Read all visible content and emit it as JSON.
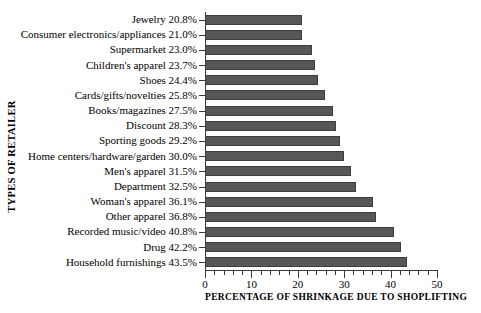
{
  "chart_data": {
    "type": "bar",
    "orientation": "horizontal",
    "title": "",
    "xlabel": "PERCENTAGE OF SHRINKAGE DUE TO SHOPLIFTING",
    "ylabel": "TYPES OF RETAILER",
    "xlim": [
      0,
      50
    ],
    "xticks": [
      0,
      10,
      20,
      30,
      40,
      50
    ],
    "xtick_labels": [
      "0",
      "10",
      "20",
      "30",
      "40",
      "50"
    ],
    "minor_tick_interval": 2,
    "grid": false,
    "legend": false,
    "bar_color": "#575757",
    "bar_edge_color": "#3d3d3d",
    "axis_color": "#3a3a3a",
    "categories": [
      "Jewelry",
      "Consumer electronics/appliances",
      "Supermarket",
      "Children's apparel",
      "Shoes",
      "Cards/gifts/novelties",
      "Books/magazines",
      "Discount",
      "Sporting goods",
      "Home centers/hardware/garden",
      "Men's apparel",
      "Department",
      "Woman's apparel",
      "Other apparel",
      "Recorded music/video",
      "Drug",
      "Household furnishings"
    ],
    "values": [
      20.8,
      21.0,
      23.0,
      23.7,
      24.4,
      25.8,
      27.5,
      28.3,
      29.2,
      30.0,
      31.5,
      32.5,
      36.1,
      36.8,
      40.8,
      42.2,
      43.5
    ],
    "tick_labels": [
      "Jewelry 20.8%",
      "Consumer electronics/appliances 21.0%",
      "Supermarket 23.0%",
      "Children's apparel 23.7%",
      "Shoes 24.4%",
      "Cards/gifts/novelties 25.8%",
      "Books/magazines 27.5%",
      "Discount 28.3%",
      "Sporting goods 29.2%",
      "Home centers/hardware/garden 30.0%",
      "Men's apparel 31.5%",
      "Department 32.5%",
      "Woman's apparel 36.1%",
      "Other apparel 36.8%",
      "Recorded music/video 40.8%",
      "Drug 42.2%",
      "Household furnishings 43.5%"
    ]
  }
}
